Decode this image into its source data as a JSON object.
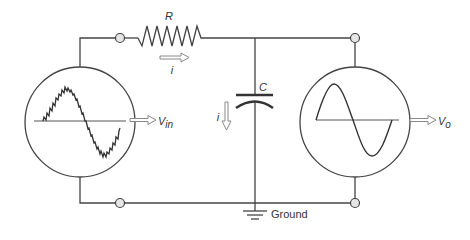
{
  "diagram": {
    "components": {
      "resistor": {
        "label": "R"
      },
      "capacitor": {
        "label": "C"
      },
      "current_resistor": {
        "label": "i"
      },
      "current_capacitor": {
        "label": "i"
      },
      "ground": {
        "label": "Ground"
      },
      "input_scope": {
        "label_main": "V",
        "label_sub": "in",
        "waveform": "noisy sine"
      },
      "output_scope": {
        "label_main": "V",
        "label_sub": "o",
        "waveform": "clean sine"
      }
    },
    "colors": {
      "wire": "#444444",
      "terminal_fill": "#e6e6e6",
      "arrow_stroke": "#888888"
    }
  }
}
